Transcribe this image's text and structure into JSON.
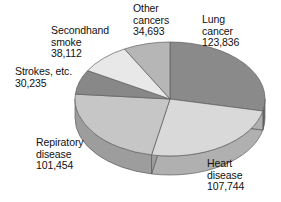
{
  "chart_data": {
    "type": "pie",
    "title": "",
    "subtitle": "",
    "xlabel": "",
    "ylabel": "",
    "legend_position": "none",
    "grid": false,
    "value_total": 436074,
    "categories": [
      "Lung cancer",
      "Heart disease",
      "Repiratory disease",
      "Strokes, etc.",
      "Secondhand smoke",
      "Other cancers"
    ],
    "values": [
      123836,
      107744,
      101454,
      30235,
      38112,
      34693
    ],
    "slices": [
      {
        "name": "lung-cancer",
        "label_lines": [
          "Lung",
          "cancer",
          "123,836"
        ],
        "value": 123836,
        "value_text": "123,836",
        "percent": 28.4,
        "start_angle_deg": 0,
        "end_angle_deg": 102.2,
        "color": "#8a8a8a",
        "side_color": "#6f6f6f"
      },
      {
        "name": "heart-disease",
        "label_lines": [
          "Heart",
          "disease",
          "107,744"
        ],
        "value": 107744,
        "value_text": "107,744",
        "percent": 24.7,
        "start_angle_deg": 102.2,
        "end_angle_deg": 191.2,
        "color": "#d9d9d9",
        "side_color": "#b0b0b0"
      },
      {
        "name": "repiratory-disease",
        "label_lines": [
          "Repiratory",
          "disease",
          "101,454"
        ],
        "value": 101454,
        "value_text": "101,454",
        "percent": 23.3,
        "start_angle_deg": 191.2,
        "end_angle_deg": 274.9,
        "color": "#c6c6c6",
        "side_color": "#9d9d9d"
      },
      {
        "name": "strokes-etc",
        "label_lines": [
          "Strokes, etc.",
          "30,235"
        ],
        "value": 30235,
        "value_text": "30,235",
        "percent": 6.9,
        "start_angle_deg": 274.9,
        "end_angle_deg": 299.9,
        "color": "#888888",
        "side_color": "#6c6c6c"
      },
      {
        "name": "secondhand-smoke",
        "label_lines": [
          "Secondhand",
          "smoke",
          "38,112"
        ],
        "value": 38112,
        "value_text": "38,112",
        "percent": 8.7,
        "start_angle_deg": 299.9,
        "end_angle_deg": 331.4,
        "color": "#e8e8e8",
        "side_color": "#bdbdbd"
      },
      {
        "name": "other-cancers",
        "label_lines": [
          "Other",
          "cancers",
          "34,693"
        ],
        "value": 34693,
        "value_text": "34,693",
        "percent": 8.0,
        "start_angle_deg": 331.4,
        "end_angle_deg": 360,
        "color": "#b6b6b6",
        "side_color": "#919191"
      }
    ]
  },
  "labels": {
    "lung_cancer": {
      "line1": "Lung",
      "line2": "cancer",
      "line3": "123,836"
    },
    "heart_disease": {
      "line1": "Heart",
      "line2": "disease",
      "line3": "107,744"
    },
    "repiratory_disease": {
      "line1": "Repiratory",
      "line2": "disease",
      "line3": "101,454"
    },
    "strokes": {
      "line1": "Strokes, etc.",
      "line2": "30,235"
    },
    "secondhand_smoke": {
      "line1": "Secondhand",
      "line2": "smoke",
      "line3": "38,112"
    },
    "other_cancers": {
      "line1": "Other",
      "line2": "cancers",
      "line3": "34,693"
    }
  }
}
